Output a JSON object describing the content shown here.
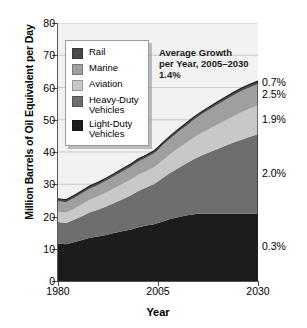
{
  "chart_data": {
    "type": "area",
    "stacked": true,
    "title": "",
    "subtitle": "",
    "xlabel": "Year",
    "ylabel": "Million Barrels of Oil Equivalent per Day",
    "xlim": [
      1980,
      2030
    ],
    "ylim": [
      0,
      80
    ],
    "yticks": [
      0,
      10,
      20,
      30,
      40,
      50,
      60,
      70,
      80
    ],
    "ytick_labels": [
      "0",
      "10",
      "20",
      "30",
      "40",
      "50",
      "60",
      "70",
      "80"
    ],
    "xticks": [
      1980,
      2005,
      2030
    ],
    "xtick_labels": [
      "1980",
      "2005",
      "2030"
    ],
    "grid": "horizontal",
    "legend_position": "upper-left-inside",
    "x": [
      1980,
      1982,
      1984,
      1986,
      1988,
      1990,
      1992,
      1994,
      1996,
      1998,
      2000,
      2002,
      2004,
      2005,
      2006,
      2008,
      2010,
      2012,
      2014,
      2016,
      2018,
      2020,
      2022,
      2024,
      2026,
      2028,
      2030
    ],
    "series": [
      {
        "name": "Light-Duty Vehicles",
        "color": "#1c1c1c",
        "growth_label": "0.3%",
        "values": [
          11.6,
          11.4,
          12.0,
          12.7,
          13.4,
          13.8,
          14.3,
          14.9,
          15.4,
          15.9,
          16.6,
          17.2,
          17.6,
          18.0,
          18.4,
          19.2,
          19.8,
          20.3,
          20.7,
          20.9,
          20.9,
          20.9,
          20.9,
          20.9,
          20.9,
          20.9,
          20.9
        ]
      },
      {
        "name": "Heavy-Duty Vehicles",
        "color": "#6e6e6e",
        "growth_label": "2.0%",
        "values": [
          6.7,
          6.6,
          7.0,
          7.4,
          7.9,
          8.3,
          8.8,
          9.3,
          9.9,
          10.5,
          11.2,
          11.8,
          12.5,
          12.9,
          13.4,
          14.3,
          15.2,
          16.1,
          17.1,
          18.1,
          19.1,
          20.1,
          21.1,
          22.1,
          23.0,
          23.8,
          24.6
        ]
      },
      {
        "name": "Aviation",
        "color": "#c8c8c8",
        "growth_label": "1.9%",
        "values": [
          3.2,
          3.2,
          3.4,
          3.7,
          3.9,
          4.1,
          4.3,
          4.5,
          4.7,
          4.9,
          5.1,
          5.0,
          5.2,
          5.3,
          5.5,
          5.8,
          6.1,
          6.4,
          6.7,
          7.0,
          7.3,
          7.6,
          7.9,
          8.2,
          8.5,
          8.8,
          9.0
        ]
      },
      {
        "name": "Marine",
        "color": "#9f9f9f",
        "growth_label": "2.5%",
        "values": [
          3.2,
          3.2,
          3.3,
          3.4,
          3.5,
          3.6,
          3.7,
          3.8,
          3.9,
          4.0,
          4.1,
          4.2,
          4.3,
          4.4,
          4.6,
          4.8,
          5.1,
          5.3,
          5.6,
          5.8,
          6.0,
          6.2,
          6.4,
          6.5,
          6.6,
          6.6,
          6.6
        ]
      },
      {
        "name": "Rail",
        "color": "#4a4a4a",
        "growth_label": "0.7%",
        "values": [
          0.8,
          0.8,
          0.8,
          0.8,
          0.8,
          0.8,
          0.8,
          0.8,
          0.8,
          0.8,
          0.8,
          0.8,
          0.8,
          0.8,
          0.8,
          0.8,
          0.8,
          0.8,
          0.8,
          0.8,
          0.8,
          0.85,
          0.85,
          0.9,
          0.9,
          0.9,
          0.9
        ]
      }
    ],
    "totals": {
      "1980": 25.5,
      "2005": 41.4,
      "2030": 62.0
    },
    "annotation": "Average Growth\nper Year, 2005–2030\n1.4%"
  },
  "legend": {
    "items": [
      {
        "label": "Rail",
        "color": "#4a4a4a"
      },
      {
        "label": "Marine",
        "color": "#9f9f9f"
      },
      {
        "label": "Aviation",
        "color": "#c8c8c8"
      },
      {
        "label": "Heavy-Duty\nVehicles",
        "color": "#6e6e6e"
      },
      {
        "label": "Light-Duty\nVehicles",
        "color": "#1c1c1c"
      }
    ]
  },
  "right_labels": [
    {
      "text": "0.7%",
      "series": "Rail"
    },
    {
      "text": "2.5%",
      "series": "Marine"
    },
    {
      "text": "1.9%",
      "series": "Aviation"
    },
    {
      "text": "2.0%",
      "series": "Heavy-Duty Vehicles"
    },
    {
      "text": "0.3%",
      "series": "Light-Duty Vehicles"
    }
  ]
}
